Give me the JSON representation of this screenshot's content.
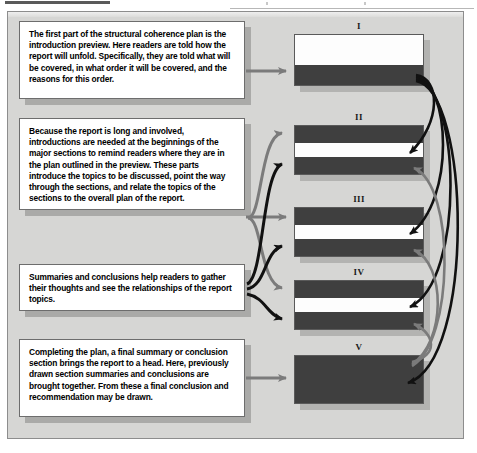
{
  "figure": {
    "background_color": "#d6d6d4",
    "border_color": "#8d8d8d"
  },
  "colors": {
    "band_dark": "#3f3f3f",
    "band_light": "#fdfdfd",
    "connector_black": "#111111",
    "connector_gray": "#7b7b7b",
    "panel_bg": "#d6d6d4",
    "shadow": "#b3b3b1"
  },
  "callouts": [
    {
      "id": "introduction-preview",
      "text": "The first part of the structural coherence plan is the introduction preview.  Here readers are told how the report will unfold.  Specifically, they are told what will be covered, in what order it will be covered, and the reasons for this order."
    },
    {
      "id": "section-introductions",
      "text": "Because the report is long and involved, introductions are needed at the beginnings of the major sections to remind readers where they are in the plan outlined in the preview. These parts introduce the topics to be discussed, point the way through the sections, and relate the topics of the sections to the overall plan of the report."
    },
    {
      "id": "summaries-and-conclusions",
      "text": "Summaries and conclusions help readers to gather their thoughts and see the relationships of the report topics."
    },
    {
      "id": "final-summary-conclusion",
      "text": "Completing the plan, a final summary or conclusion section brings the report to a head. Here, previously drawn section summaries and conclusions are brought together.  From these a final conclusion and recommendation may be drawn."
    }
  ],
  "sections": [
    {
      "label": "I",
      "bands": [
        {
          "kind": "light",
          "weight": 30
        },
        {
          "kind": "dark",
          "weight": 20
        }
      ]
    },
    {
      "label": "II",
      "bands": [
        {
          "kind": "dark",
          "weight": 18
        },
        {
          "kind": "light",
          "weight": 14
        },
        {
          "kind": "dark",
          "weight": 18
        }
      ]
    },
    {
      "label": "III",
      "bands": [
        {
          "kind": "dark",
          "weight": 18
        },
        {
          "kind": "light",
          "weight": 14
        },
        {
          "kind": "dark",
          "weight": 18
        }
      ]
    },
    {
      "label": "IV",
      "bands": [
        {
          "kind": "dark",
          "weight": 18
        },
        {
          "kind": "light",
          "weight": 14
        },
        {
          "kind": "dark",
          "weight": 18
        }
      ]
    },
    {
      "label": "V",
      "bands": [
        {
          "kind": "dark",
          "weight": 50
        }
      ]
    }
  ],
  "connectors": {
    "callout_arrows": [
      {
        "from": "introduction-preview",
        "to": "I",
        "color": "gray"
      },
      {
        "from": "section-introductions",
        "to": "II",
        "color": "gray"
      },
      {
        "from": "section-introductions",
        "to": "III",
        "color": "black"
      },
      {
        "from": "section-introductions",
        "to": "IV",
        "color": "gray"
      },
      {
        "from": "section-introductions",
        "to": "V",
        "color": "black"
      },
      {
        "from": "summaries-and-conclusions",
        "to": "II",
        "color": "gray"
      },
      {
        "from": "summaries-and-conclusions",
        "to": "III",
        "color": "black"
      },
      {
        "from": "final-summary-conclusion",
        "to": "V",
        "color": "gray"
      }
    ],
    "preview_links": [
      {
        "from": "I",
        "to": "II",
        "color": "black"
      },
      {
        "from": "I",
        "to": "III",
        "color": "black"
      },
      {
        "from": "I",
        "to": "IV",
        "color": "black"
      },
      {
        "from": "I",
        "to": "V",
        "color": "black"
      }
    ],
    "summary_links": [
      {
        "from": "V",
        "to": "IV",
        "color": "gray"
      },
      {
        "from": "IV",
        "to": "III",
        "color": "gray"
      },
      {
        "from": "III",
        "to": "II",
        "color": "gray"
      }
    ]
  }
}
